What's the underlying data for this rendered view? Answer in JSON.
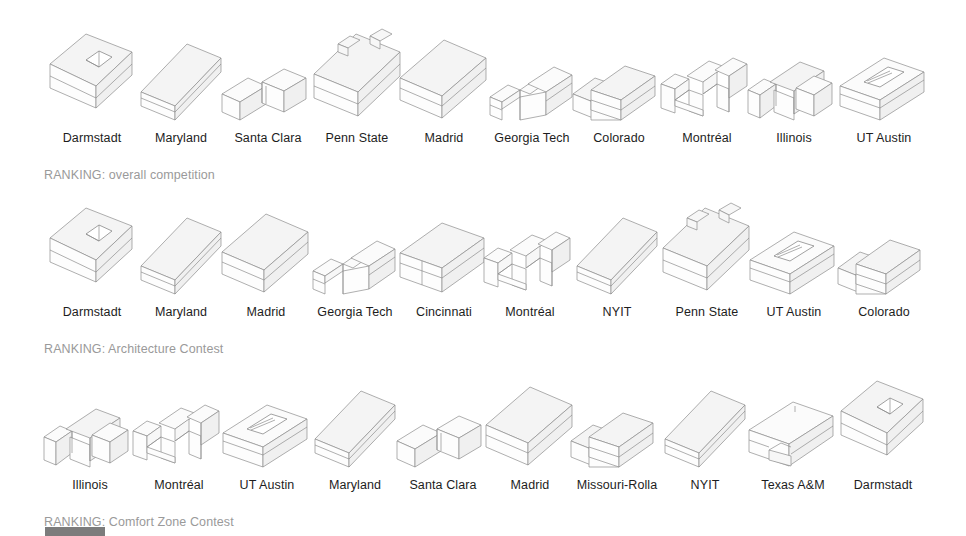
{
  "page": {
    "background_color": "#ffffff",
    "text_color": "#1d1d1d",
    "caption_color": "#9a9a9a",
    "marker_color": "#7c7c7c"
  },
  "rows": [
    {
      "caption": "RANKING: overall competition",
      "entries": [
        {
          "rank": 1,
          "label": "Darmstadt",
          "shape": "box-hip-roof-skylight"
        },
        {
          "rank": 2,
          "label": "Maryland",
          "shape": "long-shed-slope"
        },
        {
          "rank": 3,
          "label": "Santa Clara",
          "shape": "stepped-split-low"
        },
        {
          "rank": 4,
          "label": "Penn State",
          "shape": "gable-with-chimneys"
        },
        {
          "rank": 5,
          "label": "Madrid",
          "shape": "long-gable-plain"
        },
        {
          "rank": 6,
          "label": "Georgia Tech",
          "shape": "long-bar-notch"
        },
        {
          "rank": 7,
          "label": "Colorado",
          "shape": "twin-slope-offset"
        },
        {
          "rank": 8,
          "label": "Montréal",
          "shape": "double-notch-block"
        },
        {
          "rank": 9,
          "label": "Illinois",
          "shape": "split-twin-notch"
        },
        {
          "rank": 10,
          "label": "UT Austin",
          "shape": "bar-with-roof-slot"
        }
      ]
    },
    {
      "caption": "RANKING: Architecture Contest",
      "entries": [
        {
          "rank": 1,
          "label": "Darmstadt",
          "shape": "box-hip-roof-skylight"
        },
        {
          "rank": 2,
          "label": "Maryland",
          "shape": "long-shed-slope"
        },
        {
          "rank": 3,
          "label": "Madrid",
          "shape": "long-gable-plain"
        },
        {
          "rank": 4,
          "label": "Georgia Tech",
          "shape": "long-bar-notch"
        },
        {
          "rank": 5,
          "label": "Cincinnati",
          "shape": "twin-box-divided"
        },
        {
          "rank": 6,
          "label": "Montréal",
          "shape": "double-notch-block"
        },
        {
          "rank": 7,
          "label": "NYIT",
          "shape": "long-shed-slope"
        },
        {
          "rank": 8,
          "label": "Penn State",
          "shape": "gable-with-chimneys"
        },
        {
          "rank": 9,
          "label": "UT Austin",
          "shape": "bar-with-roof-slot"
        },
        {
          "rank": 10,
          "label": "Colorado",
          "shape": "twin-slope-offset"
        }
      ]
    },
    {
      "caption": "RANKING: Comfort Zone Contest",
      "entries": [
        {
          "rank": 1,
          "label": "Illinois",
          "shape": "split-twin-notch"
        },
        {
          "rank": 2,
          "label": "Montréal",
          "shape": "double-notch-block"
        },
        {
          "rank": 3,
          "label": "UT Austin",
          "shape": "bar-with-roof-slot"
        },
        {
          "rank": 4,
          "label": "Maryland",
          "shape": "long-shed-slope"
        },
        {
          "rank": 5,
          "label": "Santa Clara",
          "shape": "stepped-split-low"
        },
        {
          "rank": 6,
          "label": "Madrid",
          "shape": "long-gable-plain"
        },
        {
          "rank": 7,
          "label": "Missouri-Rolla",
          "shape": "twin-slope-offset"
        },
        {
          "rank": 8,
          "label": "NYIT",
          "shape": "long-shed-slope"
        },
        {
          "rank": 9,
          "label": "Texas A&M",
          "shape": "bar-low-ledge"
        },
        {
          "rank": 10,
          "label": "Darmstadt",
          "shape": "box-hip-roof-skylight"
        }
      ]
    }
  ],
  "footer": {
    "progress_marker": "slide-progress-bar"
  }
}
